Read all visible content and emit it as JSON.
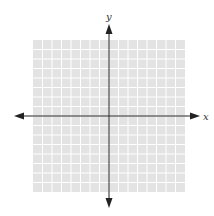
{
  "diagram": {
    "type": "coordinate-plane",
    "grid": {
      "columns": 16,
      "rows": 16,
      "cell_px": 9.5,
      "left": 33,
      "top": 40,
      "background_color": "#e3e3e3",
      "line_color": "#ffffff"
    },
    "axes": {
      "origin_px": [
        109,
        116
      ],
      "color": "#222222",
      "x_axis": {
        "label": "x",
        "from_px": 16,
        "to_px": 198,
        "arrows": "both"
      },
      "y_axis": {
        "label": "y",
        "from_px": 25,
        "to_px": 207,
        "arrows": "both"
      }
    }
  }
}
